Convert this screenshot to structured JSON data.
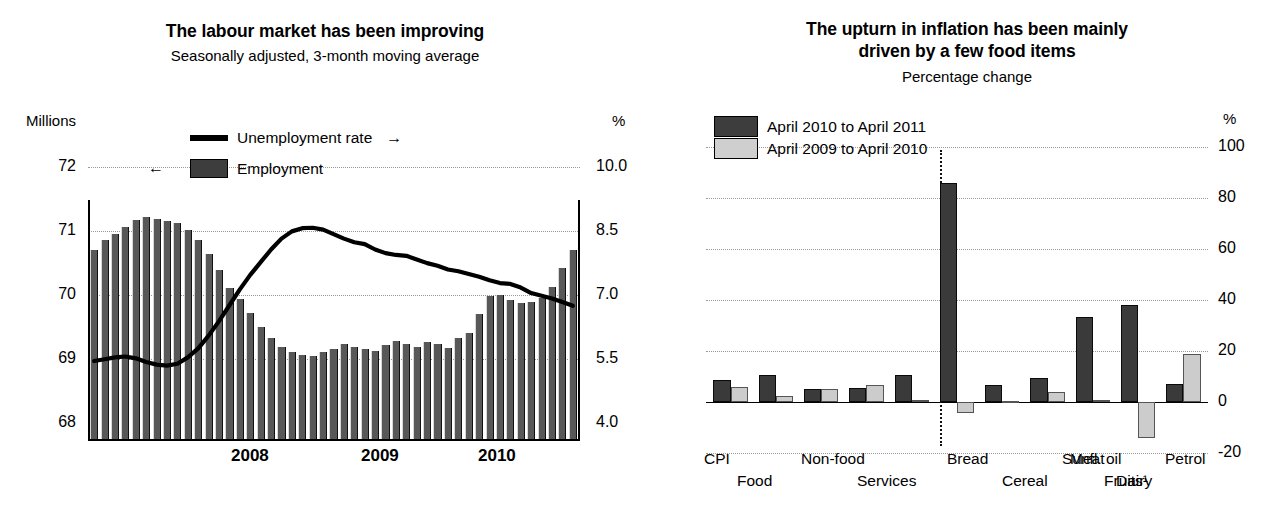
{
  "left": {
    "title": "The labour market has been improving",
    "subtitle": "Seasonally adjusted, 3-month moving average",
    "left_axis_unit": "Millions",
    "right_axis_unit": "%",
    "legend": [
      {
        "label": "Unemployment rate",
        "marker": "line",
        "arrow": "→",
        "arrow_side": "right"
      },
      {
        "label": "Employment",
        "marker": "box-dark",
        "arrow": "←",
        "arrow_side": "left"
      }
    ],
    "chart_data": {
      "type": "bar",
      "title": "The labour market has been improving",
      "subtitle": "Seasonally adjusted, 3-month moving average",
      "xlabel": "",
      "ylabel": "Millions",
      "y2label": "%",
      "ylim": [
        68,
        72
      ],
      "yticks": [
        "68",
        "69",
        "70",
        "71",
        "72"
      ],
      "y2lim": [
        4.0,
        10.0
      ],
      "y2ticks": [
        "4.0",
        "5.5",
        "7.0",
        "8.5",
        "10.0"
      ],
      "xticks": [
        "2008",
        "2009",
        "2010"
      ],
      "grid": true,
      "legend_position": "top-center",
      "series": [
        {
          "name": "Employment",
          "type": "bar",
          "axis": "left",
          "unit": "Millions",
          "values": [
            70.78,
            70.92,
            71.02,
            71.12,
            71.22,
            71.26,
            71.24,
            71.21,
            71.18,
            71.08,
            70.92,
            70.72,
            70.48,
            70.22,
            70.06,
            69.86,
            69.64,
            69.48,
            69.36,
            69.28,
            69.24,
            69.22,
            69.28,
            69.32,
            69.4,
            69.36,
            69.32,
            69.3,
            69.38,
            69.44,
            69.4,
            69.36,
            69.42,
            69.4,
            69.34,
            69.48,
            69.56,
            69.84,
            70.1,
            70.12,
            70.04,
            70.0,
            70.02,
            70.08,
            70.24,
            70.52,
            70.78
          ]
        },
        {
          "name": "Unemployment rate",
          "type": "line",
          "axis": "right",
          "unit": "%",
          "values": [
            5.72,
            5.76,
            5.8,
            5.82,
            5.78,
            5.7,
            5.64,
            5.62,
            5.66,
            5.8,
            6.0,
            6.28,
            6.6,
            6.95,
            7.3,
            7.62,
            7.9,
            8.18,
            8.42,
            8.58,
            8.65,
            8.66,
            8.62,
            8.52,
            8.42,
            8.34,
            8.3,
            8.18,
            8.1,
            8.06,
            8.04,
            7.96,
            7.88,
            7.82,
            7.74,
            7.7,
            7.64,
            7.58,
            7.5,
            7.44,
            7.42,
            7.34,
            7.22,
            7.16,
            7.1,
            7.02,
            6.94
          ]
        }
      ]
    }
  },
  "right": {
    "title_line1": "The upturn in inflation has been mainly",
    "title_line2": "driven by a few food items",
    "subtitle": "Percentage change",
    "axis_unit": "%",
    "legend": [
      {
        "label": "April 2010 to April 2011",
        "swatch": "dark"
      },
      {
        "label": "April 2009 to April 2010",
        "swatch": "light"
      }
    ],
    "footnote_marker": "1",
    "chart_data": {
      "type": "bar",
      "title": "The upturn in inflation has been mainly driven by a few food items",
      "subtitle": "Percentage change",
      "xlabel": "",
      "ylabel": "Percentage change",
      "y2label": "%",
      "ylim": [
        -20,
        100
      ],
      "yticks": [
        "-20",
        "0",
        "20",
        "40",
        "60",
        "80",
        "100"
      ],
      "grid": true,
      "legend_position": "top-left",
      "divider_after_category": "Services",
      "categories": [
        "CPI",
        "Food",
        "Non-food",
        "Services",
        "Bread",
        "Cereal",
        "Meat",
        "Dairy",
        "Sunfl. oil",
        "Fruits¹",
        "Petrol"
      ],
      "categories_plotted": [
        "CPI",
        "Food",
        "Non-food",
        "Services",
        "Bread",
        "Cereal",
        "Meat",
        "Dairy",
        "Sunfl. oil",
        "Fruits¹",
        "Petrol"
      ],
      "series": [
        {
          "name": "April 2010 to April 2011",
          "color": "#3a3a3a",
          "values": [
            8.5,
            10.5,
            5.0,
            5.5,
            10.5,
            86.0,
            6.5,
            9.5,
            33.5,
            38.0,
            7.0
          ]
        },
        {
          "name": "April 2009 to April 2010",
          "color": "#cccccc",
          "values": [
            6.0,
            2.5,
            5.0,
            6.5,
            0.8,
            -4.5,
            0.5,
            4.0,
            0.8,
            -14.0,
            2.0,
            19.0
          ]
        }
      ],
      "note": "Eleven label positions; ten plotted bar-pairs with Fruits and Petrol at the right end."
    }
  }
}
